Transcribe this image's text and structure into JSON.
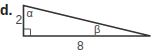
{
  "problem": {
    "part_label": "d.",
    "triangle": {
      "type": "right-triangle",
      "vertical_side_label": "2",
      "horizontal_side_label": "8",
      "angle_top_label": "α",
      "angle_right_label": "β",
      "right_angle_marker": "square",
      "line_color": "#333333"
    }
  }
}
